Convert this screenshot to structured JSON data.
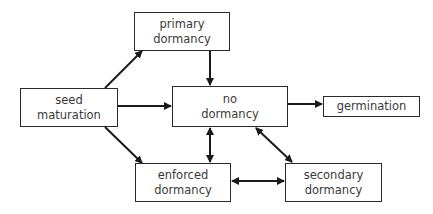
{
  "diagram": {
    "nodes": [
      {
        "id": "seed_maturation",
        "lines": [
          "seed",
          "maturation"
        ],
        "x": 20,
        "y": 88,
        "w": 98,
        "h": 39
      },
      {
        "id": "primary_dormancy",
        "lines": [
          "primary",
          "dormancy"
        ],
        "x": 134,
        "y": 12,
        "w": 96,
        "h": 39
      },
      {
        "id": "no_dormancy",
        "lines": [
          "no",
          "dormancy"
        ],
        "x": 172,
        "y": 86,
        "w": 116,
        "h": 41
      },
      {
        "id": "germination",
        "lines": [
          "germination"
        ],
        "x": 323,
        "y": 96,
        "w": 97,
        "h": 21
      },
      {
        "id": "enforced_dormancy",
        "lines": [
          "enforced",
          "dormancy"
        ],
        "x": 135,
        "y": 163,
        "w": 96,
        "h": 39
      },
      {
        "id": "secondary_dormancy",
        "lines": [
          "secondary",
          "dormancy"
        ],
        "x": 285,
        "y": 163,
        "w": 97,
        "h": 39
      }
    ],
    "edges": [
      {
        "from": "seed_maturation",
        "to": "primary_dormancy",
        "direction": "forward"
      },
      {
        "from": "seed_maturation",
        "to": "no_dormancy",
        "direction": "forward"
      },
      {
        "from": "seed_maturation",
        "to": "enforced_dormancy",
        "direction": "forward"
      },
      {
        "from": "primary_dormancy",
        "to": "no_dormancy",
        "direction": "forward"
      },
      {
        "from": "no_dormancy",
        "to": "germination",
        "direction": "forward"
      },
      {
        "from": "no_dormancy",
        "to": "enforced_dormancy",
        "direction": "both"
      },
      {
        "from": "no_dormancy",
        "to": "secondary_dormancy",
        "direction": "both"
      },
      {
        "from": "enforced_dormancy",
        "to": "secondary_dormancy",
        "direction": "both"
      }
    ]
  },
  "labels": {
    "seed_maturation": {
      "l1": "seed",
      "l2": "maturation"
    },
    "primary_dormancy": {
      "l1": "primary",
      "l2": "dormancy"
    },
    "no_dormancy": {
      "l1": "no",
      "l2": "dormancy"
    },
    "germination": {
      "l1": "germination"
    },
    "enforced_dormancy": {
      "l1": "enforced",
      "l2": "dormancy"
    },
    "secondary_dormancy": {
      "l1": "secondary",
      "l2": "dormancy"
    }
  }
}
